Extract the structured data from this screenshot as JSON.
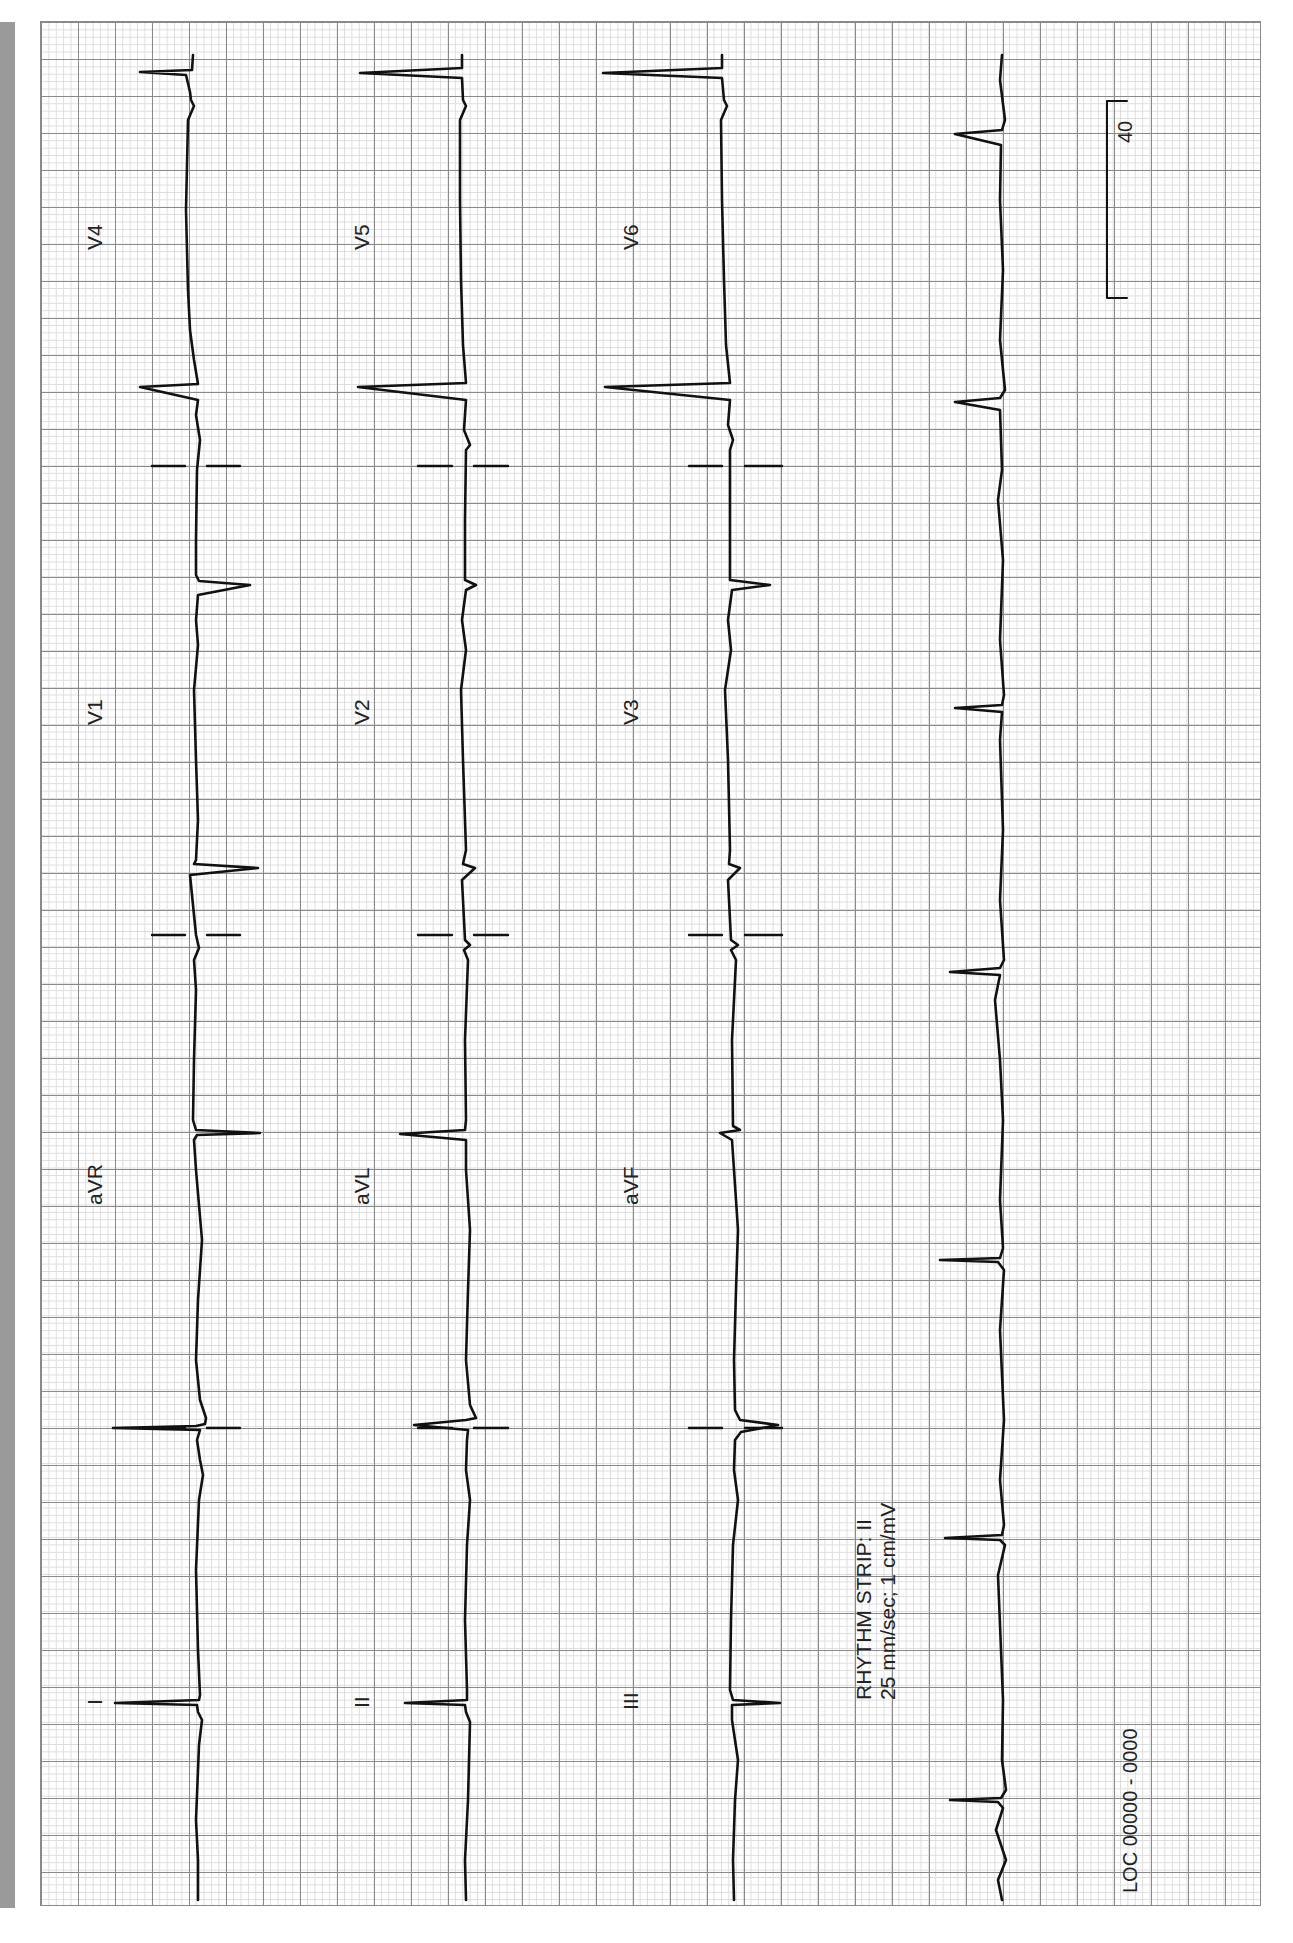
{
  "ecg": {
    "orientation": "rotated 90 degrees counter-clockwise",
    "leads": {
      "row1": [
        "I",
        "aVR",
        "V1",
        "V4"
      ],
      "row2": [
        "II",
        "aVL",
        "V2",
        "V5"
      ],
      "row3": [
        "III",
        "aVF",
        "V3",
        "V6"
      ]
    },
    "rhythm_strip": {
      "title": "RHYTHM STRIP: II",
      "settings": "25 mm/sec; 1 cm/mV"
    },
    "location_label": "LOC 00000 - 0000",
    "calibration_label": "40",
    "colors": {
      "grid_major": "#8a8a8a",
      "grid_minor": "#dcdcdc",
      "trace": "#111111",
      "side_bar": "#9a9a9a"
    }
  }
}
